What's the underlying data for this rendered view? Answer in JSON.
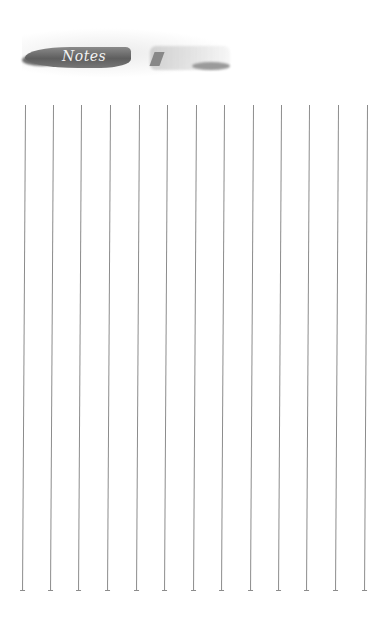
{
  "header": {
    "title": "Notes"
  },
  "ruled_columns": {
    "count": 13,
    "x_positions": [
      25,
      53,
      81,
      110,
      139,
      167,
      196,
      224,
      253,
      281,
      309,
      338,
      367
    ],
    "top": 105,
    "bottom": 590,
    "line_color": "#8c8c8c"
  }
}
